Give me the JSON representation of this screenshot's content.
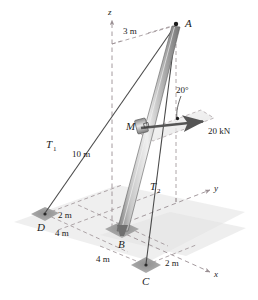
{
  "figure": {
    "type": "engineering-statics-free-body-diagram"
  },
  "colors": {
    "background": "#ffffff",
    "ground_plane": "#ebebeb",
    "pad": "#9a9a9a",
    "mast_light": "#d8d8d8",
    "mast_mid": "#a8a8a8",
    "mast_dark": "#6d6d6d",
    "cable": "#4a4a4a",
    "dashed_axis": "#9a8f93",
    "force_arrow": "#555555",
    "text": "#1b1b1b"
  },
  "points": {
    "A": {
      "label": "A",
      "x": 176,
      "y": 24
    },
    "B": {
      "label": "B",
      "x": 122,
      "y": 229
    },
    "C": {
      "label": "C",
      "x": 146,
      "y": 265
    },
    "D": {
      "label": "D",
      "x": 45,
      "y": 214
    },
    "M": {
      "label": "M",
      "x": 140,
      "y": 126
    }
  },
  "axes": {
    "z": {
      "label": "z",
      "tip_x": 112,
      "tip_y": 16
    },
    "y": {
      "label": "y",
      "tip_x": 214,
      "tip_y": 188
    },
    "x": {
      "label": "x",
      "tip_x": 214,
      "tip_y": 274
    }
  },
  "cables": [
    {
      "name": "T1",
      "label": "T",
      "subscript": "1",
      "from": "A",
      "to": "D",
      "label_x": 49,
      "label_y": 144
    },
    {
      "name": "T2",
      "label": "T",
      "subscript": "2",
      "from": "A",
      "to": "C",
      "label_x": 153,
      "label_y": 187
    }
  ],
  "dimensions": [
    {
      "label": "3 m",
      "x": 131,
      "y": 31,
      "describes": "horizontal offset of A from z-axis"
    },
    {
      "label": "10 m",
      "x": 82,
      "y": 153,
      "describes": "mast height along z"
    },
    {
      "label": "2 m",
      "x": 66,
      "y": 214,
      "describes": "D offset along y from base grid line"
    },
    {
      "label": "4 m",
      "x": 62,
      "y": 231,
      "describes": "D offset along x to B grid line"
    },
    {
      "label": "4 m",
      "x": 105,
      "y": 258,
      "describes": "B to C offset along x"
    },
    {
      "label": "2 m",
      "x": 163,
      "y": 262,
      "describes": "C offset along y"
    }
  ],
  "force": {
    "magnitude_label": "20 kN",
    "magnitude_label_x": 211,
    "magnitude_label_y": 131,
    "angle_label": "20°",
    "angle_label_x": 183,
    "angle_label_y": 90,
    "applied_at": "M",
    "tail_x": 141,
    "tail_y": 128,
    "tip_x": 206,
    "tip_y": 121
  },
  "annotations": {
    "right_angle_marker": "right-angle-square-at-M",
    "dot_marker": "angle-vertex-dot"
  }
}
